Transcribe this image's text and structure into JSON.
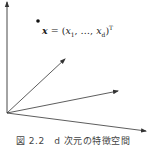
{
  "diagram": {
    "type": "vector-space",
    "origin": [
      7,
      113
    ],
    "vertical_axis": {
      "from": [
        7,
        113
      ],
      "to": [
        7,
        1
      ]
    },
    "vectors": [
      {
        "name": "vector-1",
        "to": [
          65,
          59
        ]
      },
      {
        "name": "vector-2",
        "to": [
          118,
          91
        ]
      },
      {
        "name": "vector-3",
        "to": [
          146,
          131
        ]
      }
    ],
    "point": {
      "x": 38,
      "y": 21,
      "radius": 1.8
    },
    "formula": {
      "lhs": "x",
      "eq": " = (",
      "x1": "x",
      "x1_sub": "1",
      "sep": ", …, ",
      "xd": "x",
      "xd_sub": "d",
      "close": ")",
      "sup": "T"
    },
    "caption": "図 2.2　d 次元の特徴空間",
    "colors": {
      "line": "#333333",
      "point": "#111111"
    }
  }
}
